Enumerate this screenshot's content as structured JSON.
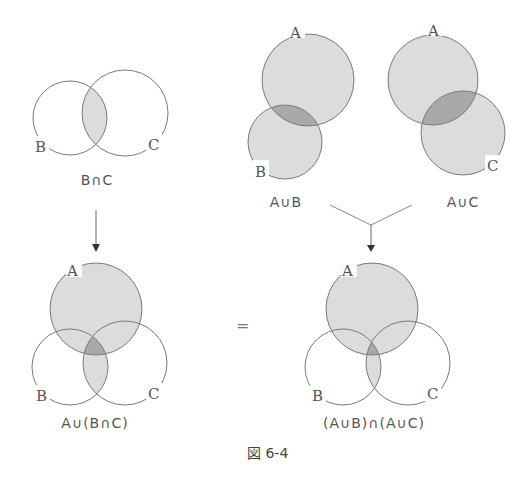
{
  "figure": {
    "caption": "図 6-4",
    "equals_sign": "=",
    "colors": {
      "stroke": "#7a7a7a",
      "shade_light": "#dcdcdc",
      "shade_dark": "#a9a9a9",
      "text": "#555555"
    }
  },
  "panels": {
    "b_and_c": {
      "title": "B∩C",
      "labels": {
        "B": "B",
        "C": "C"
      }
    },
    "a_or_b": {
      "title": "A∪B",
      "labels": {
        "A": "A",
        "B": "B"
      }
    },
    "a_or_c": {
      "title": "A∪C",
      "labels": {
        "A": "A",
        "C": "C"
      }
    },
    "a_or_b_and_c": {
      "title": "A∪(B∩C)",
      "labels": {
        "A": "A",
        "B": "B",
        "C": "C"
      }
    },
    "ab_and_ac": {
      "title": "(A∪B)∩(A∪C)",
      "labels": {
        "A": "A",
        "B": "B",
        "C": "C"
      }
    }
  }
}
